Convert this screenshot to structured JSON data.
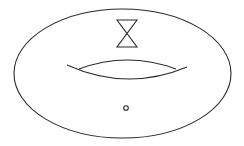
{
  "diagram": {
    "title": "",
    "colors": {
      "stroke": "#2a2a2a",
      "background": "#ffffff"
    },
    "elements": [
      {
        "id": "torus-outline",
        "shape": "ellipse",
        "cx": 122.5,
        "cy": 73.5,
        "rx": 108.5,
        "ry": 64.5
      },
      {
        "id": "hourglass",
        "shape": "double-cone",
        "top_y": 20,
        "cross_y": 33,
        "bottom_y": 47,
        "left_x": 117,
        "right_x": 137
      },
      {
        "id": "torus-hole-lower-arc",
        "shape": "arc",
        "from": [
          67,
          65
        ],
        "to": [
          187,
          67
        ],
        "control_y": 92
      },
      {
        "id": "torus-hole-upper-arc",
        "shape": "arc",
        "from": [
          79,
          69
        ],
        "to": [
          176,
          69
        ],
        "control_y": 51
      },
      {
        "id": "point-marker",
        "shape": "circle",
        "cx": 126,
        "cy": 108,
        "r": 2.3
      }
    ]
  }
}
